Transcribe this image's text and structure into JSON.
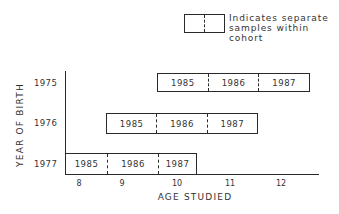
{
  "legend": {
    "line1": "Indicates separate",
    "line2": "samples within",
    "line3": "cohort"
  },
  "axes": {
    "y_title": "YEAR OF BIRTH",
    "x_title": "AGE STUDIED",
    "x_ticks": [
      "8",
      "9",
      "10",
      "11",
      "12"
    ]
  },
  "rows": [
    {
      "birth_year": "1975",
      "cells": [
        "1985",
        "1986",
        "1987"
      ]
    },
    {
      "birth_year": "1976",
      "cells": [
        "1985",
        "1986",
        "1987"
      ]
    },
    {
      "birth_year": "1977",
      "cells": [
        "1985",
        "1986",
        "1987"
      ]
    }
  ],
  "colors": {
    "ink": "#2a2a2a",
    "background": "#ffffff"
  }
}
